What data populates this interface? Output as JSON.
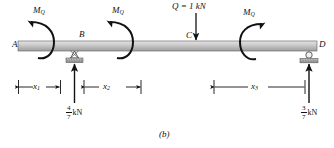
{
  "figure": {
    "caption": "(b)",
    "type": "beam-free-body-diagram"
  },
  "beam": {
    "nodes": [
      {
        "id": "A",
        "label": "A"
      },
      {
        "id": "B",
        "label": "B"
      },
      {
        "id": "C",
        "label": "C"
      },
      {
        "id": "D",
        "label": "D"
      }
    ]
  },
  "moments": [
    {
      "id": "m1",
      "label": "M",
      "subscript": "Q",
      "sense": "counterclockwise"
    },
    {
      "id": "m2",
      "label": "M",
      "subscript": "Q",
      "sense": "counterclockwise"
    },
    {
      "id": "m3",
      "label": "M",
      "subscript": "Q",
      "sense": "clockwise"
    }
  ],
  "loads": [
    {
      "id": "Q",
      "text": "Q = 1 kN",
      "direction": "down",
      "at": "C"
    }
  ],
  "reactions": [
    {
      "id": "RB",
      "num": "4",
      "den": "7",
      "unit": "kN",
      "direction": "up",
      "at": "B"
    },
    {
      "id": "RD",
      "num": "3",
      "den": "7",
      "unit": "kN",
      "direction": "up",
      "at": "D"
    }
  ],
  "dimensions": [
    {
      "id": "x1",
      "label": "x",
      "subscript": "1"
    },
    {
      "id": "x2",
      "label": "x",
      "subscript": "2"
    },
    {
      "id": "x3",
      "label": "x",
      "subscript": "3"
    }
  ],
  "supports": [
    {
      "id": "support-B",
      "kind": "pin-support"
    },
    {
      "id": "support-D",
      "kind": "roller-support"
    }
  ],
  "colors": {
    "beam_top": "#d6d6d6",
    "beam_bottom": "#9a9a9a",
    "ink": "#111111",
    "hatch": "#8e8e8e"
  }
}
